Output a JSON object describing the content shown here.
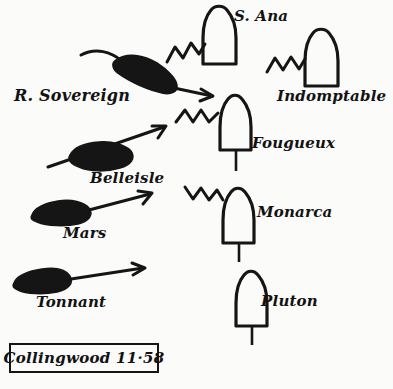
{
  "diagram": {
    "title_box": {
      "commander": "Collingwood",
      "time": "11·58",
      "full_text": "Collingwood 11·58"
    },
    "background_color": "#fbfbfa",
    "ink_color": "#151515"
  },
  "british_ships": [
    {
      "name": "R. Sovereign",
      "label_x": 14,
      "label_y": 88,
      "style": "filled-silhouette",
      "has_arrow": true
    },
    {
      "name": "Belleisle",
      "label_x": 90,
      "label_y": 171,
      "style": "filled-silhouette",
      "has_arrow": true
    },
    {
      "name": "Mars",
      "label_x": 63,
      "label_y": 226,
      "style": "filled-silhouette",
      "has_arrow": true
    },
    {
      "name": "Tonnant",
      "label_x": 36,
      "label_y": 295,
      "style": "filled-silhouette",
      "has_arrow": true
    }
  ],
  "enemy_ships": [
    {
      "name": "S. Ana",
      "label_x": 234,
      "label_y": 9,
      "style": "outline-hull",
      "under_fire": true
    },
    {
      "name": "Indomptable",
      "label_x": 277,
      "label_y": 89,
      "style": "outline-hull",
      "under_fire": true
    },
    {
      "name": "Fougueux",
      "label_x": 252,
      "label_y": 136,
      "style": "outline-hull",
      "under_fire": true
    },
    {
      "name": "Monarca",
      "label_x": 257,
      "label_y": 205,
      "style": "outline-hull",
      "under_fire": true
    },
    {
      "name": "Pluton",
      "label_x": 261,
      "label_y": 294,
      "style": "outline-hull",
      "under_fire": false
    }
  ],
  "gunfire_markers": {
    "symbol": "zigzag-line",
    "count": 4
  }
}
